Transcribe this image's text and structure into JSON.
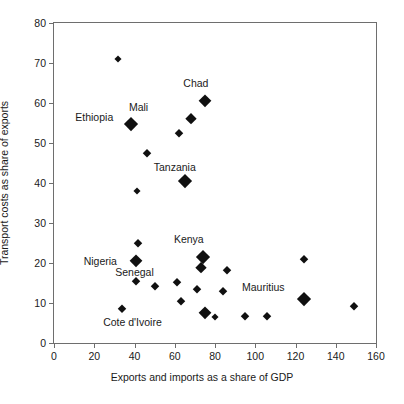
{
  "chart_data": {
    "type": "scatter",
    "title": "",
    "xlabel": "Exports and imports as a share of GDP",
    "ylabel": "Transport costs as share of exports",
    "xlim": [
      0,
      160
    ],
    "ylim": [
      0,
      80
    ],
    "xticks": [
      0,
      20,
      40,
      60,
      80,
      100,
      120,
      140,
      160
    ],
    "yticks": [
      0,
      10,
      20,
      30,
      40,
      50,
      60,
      70,
      80
    ],
    "grid": false,
    "legend": "none",
    "marker": "filled-diamond",
    "marker_color": "#101010",
    "points": [
      {
        "x": 32,
        "y": 71,
        "size": 7,
        "label": ""
      },
      {
        "x": 38.5,
        "y": 54.8,
        "size": 14,
        "label": "Mali"
      },
      {
        "x": 68,
        "y": 56,
        "size": 12,
        "label": ""
      },
      {
        "x": 75,
        "y": 60.5,
        "size": 13,
        "label": "Chad"
      },
      {
        "x": 62,
        "y": 52.5,
        "size": 8,
        "label": ""
      },
      {
        "x": 46,
        "y": 47.5,
        "size": 8,
        "label": ""
      },
      {
        "x": 65,
        "y": 40.5,
        "size": 14,
        "label": "Tanzania"
      },
      {
        "x": 41,
        "y": 38,
        "size": 7,
        "label": ""
      },
      {
        "x": 41.5,
        "y": 25,
        "size": 8,
        "label": ""
      },
      {
        "x": 40.5,
        "y": 20.5,
        "size": 13,
        "label": "Senegal"
      },
      {
        "x": 40.5,
        "y": 15.5,
        "size": 8,
        "label": ""
      },
      {
        "x": 50,
        "y": 14.2,
        "size": 8,
        "label": ""
      },
      {
        "x": 61,
        "y": 15.2,
        "size": 8,
        "label": ""
      },
      {
        "x": 63,
        "y": 10.5,
        "size": 8,
        "label": ""
      },
      {
        "x": 34,
        "y": 8.5,
        "size": 9,
        "label": "Cote d'Ivoire"
      },
      {
        "x": 74,
        "y": 21.5,
        "size": 14,
        "label": "Kenya"
      },
      {
        "x": 73,
        "y": 18.8,
        "size": 12,
        "label": ""
      },
      {
        "x": 71,
        "y": 13.5,
        "size": 8,
        "label": ""
      },
      {
        "x": 75,
        "y": 7.5,
        "size": 13,
        "label": ""
      },
      {
        "x": 80,
        "y": 6.5,
        "size": 7,
        "label": ""
      },
      {
        "x": 86,
        "y": 18.2,
        "size": 8,
        "label": ""
      },
      {
        "x": 84,
        "y": 13,
        "size": 8,
        "label": ""
      },
      {
        "x": 95,
        "y": 6.8,
        "size": 8,
        "label": ""
      },
      {
        "x": 106,
        "y": 6.8,
        "size": 8,
        "label": ""
      },
      {
        "x": 124,
        "y": 21,
        "size": 8,
        "label": ""
      },
      {
        "x": 124,
        "y": 11,
        "size": 14,
        "label": "Mauritius"
      },
      {
        "x": 149,
        "y": 9.3,
        "size": 8,
        "label": ""
      }
    ],
    "annotations": [
      {
        "text": "Ethiopia",
        "x": 20,
        "y": 56.5
      },
      {
        "text": "Mali",
        "x": 42,
        "y": 59
      },
      {
        "text": "Chad",
        "x": 70.5,
        "y": 65
      },
      {
        "text": "Tanzania",
        "x": 60,
        "y": 44
      },
      {
        "text": "Kenya",
        "x": 67,
        "y": 26
      },
      {
        "text": "Nigeria",
        "x": 23,
        "y": 20.5
      },
      {
        "text": "Senegal",
        "x": 40,
        "y": 17.8
      },
      {
        "text": "Cote d'Ivoire",
        "x": 39,
        "y": 5.2
      },
      {
        "text": "Mauritius",
        "x": 104,
        "y": 14
      }
    ]
  }
}
